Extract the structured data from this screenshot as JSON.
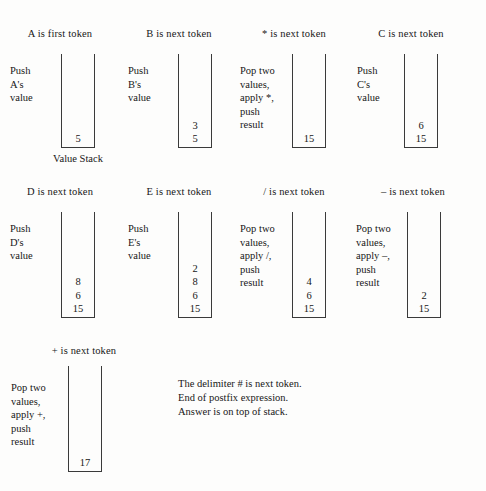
{
  "figure": {
    "stack_label": "Value Stack",
    "note_lines": [
      "The delimiter # is next token.",
      "End of postfix expression.",
      "Answer is on top of stack."
    ],
    "steps": [
      {
        "caption": "A is first token",
        "desc_lines": [
          "Push",
          "A's",
          "value"
        ],
        "stack": [
          "5"
        ]
      },
      {
        "caption": "B is next token",
        "desc_lines": [
          "Push",
          "B's",
          "value"
        ],
        "stack": [
          "3",
          "5"
        ]
      },
      {
        "caption": "* is next token",
        "desc_lines": [
          "Pop two",
          "values,",
          "apply *,",
          "push",
          "result"
        ],
        "stack": [
          "15"
        ]
      },
      {
        "caption": "C is next token",
        "desc_lines": [
          "Push",
          "C's",
          "value"
        ],
        "stack": [
          "6",
          "15"
        ]
      },
      {
        "caption": "D is next token",
        "desc_lines": [
          "Push",
          "D's",
          "value"
        ],
        "stack": [
          "8",
          "6",
          "15"
        ]
      },
      {
        "caption": "E is next token",
        "desc_lines": [
          "Push",
          "E's",
          "value"
        ],
        "stack": [
          "2",
          "8",
          "6",
          "15"
        ]
      },
      {
        "caption": "/ is next token",
        "desc_lines": [
          "Pop two",
          "values,",
          "apply /,",
          "push",
          "result"
        ],
        "stack": [
          "4",
          "6",
          "15"
        ]
      },
      {
        "caption": "– is next token",
        "desc_lines": [
          "Pop two",
          "values,",
          "apply –,",
          "push",
          "result"
        ],
        "stack": [
          "2",
          "15"
        ]
      },
      {
        "caption": "+ is next token",
        "desc_lines": [
          "Pop two",
          "values,",
          "apply +,",
          "push",
          "result"
        ],
        "stack": [
          "17"
        ]
      }
    ]
  }
}
